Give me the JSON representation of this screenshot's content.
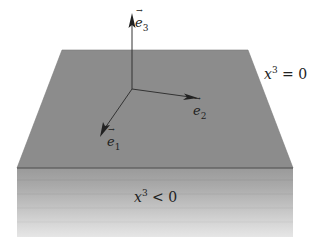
{
  "diagram": {
    "plane_label": "x³ = 0",
    "plane_label_base": "x",
    "plane_label_sup": "3",
    "plane_label_rel": " = 0",
    "below_label_base": "x",
    "below_label_sup": "3",
    "below_label_rel": " < 0",
    "vectors": [
      {
        "name": "e",
        "sub": "1"
      },
      {
        "name": "e",
        "sub": "2"
      },
      {
        "name": "e",
        "sub": "3"
      }
    ],
    "colors": {
      "plane_top": "#8c8c8c",
      "plane_edge": "#555555",
      "band_top": "#9a9a9a",
      "band_bottom": "#e6e6e6",
      "arrow": "#333333"
    }
  }
}
